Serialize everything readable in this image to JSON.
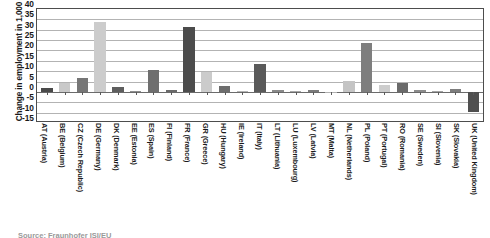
{
  "chart_data": {
    "type": "bar",
    "title": "",
    "xlabel": "",
    "ylabel": "Change in employment in 1,000",
    "ylim": [
      -15,
      40
    ],
    "yticks": [
      40,
      35,
      30,
      25,
      20,
      15,
      10,
      5,
      0,
      -5,
      -10,
      -15
    ],
    "grid": true,
    "legend": "none",
    "categories": [
      "AT (Austria)",
      "BE (Belgium)",
      "CZ (Czech Republic)",
      "DE (Germany)",
      "DK (Denmark)",
      "EE (Estonia)",
      "ES (Spain)",
      "FI (Finland)",
      "FR (France)",
      "GR (Greece)",
      "HU (Hungary)",
      "IE (Ireland)",
      "IT (Italy)",
      "LT (Lithuania)",
      "LU (Luxembourg)",
      "LV (Latvia)",
      "MT (Malta)",
      "NL (Netherlands)",
      "PL (Poland)",
      "PT (Portugal)",
      "RO (Romania)",
      "SE (Sweden)",
      "SI (Slovenia)",
      "SK (Slovakia)",
      "UK (United Kingdom)"
    ],
    "values": [
      2.0,
      4.1,
      6.9,
      33.6,
      2.6,
      0.4,
      10.7,
      1.0,
      31.3,
      9.8,
      2.7,
      0.2,
      13.6,
      0.7,
      0.2,
      0.9,
      0.1,
      5.2,
      23.7,
      3.4,
      4.4,
      0.8,
      0.3,
      1.4,
      -9.6
    ],
    "bar_colors": [
      "#4a4a4a",
      "#c9c9c9",
      "#767676",
      "#cccccc",
      "#5e5e5e",
      "#8f8f8f",
      "#6e6e6e",
      "#6a6a6a",
      "#4c4c4c",
      "#cbcbcb",
      "#6d6d6d",
      "#b5b5b5",
      "#5a5a5a",
      "#8a8a8a",
      "#a8a8a8",
      "#7a7a7a",
      "#b0b0b0",
      "#c4c4c4",
      "#7e7e7e",
      "#cdcdcd",
      "#6a6a6a",
      "#8c8c8c",
      "#a4a4a4",
      "#7d7d7d",
      "#4f4f4f"
    ]
  },
  "axis": {
    "y_title": "Change in employment in 1,000"
  },
  "footer": {
    "source": "Source: Fraunhofer ISI/EU"
  },
  "colors": {
    "grid": "#b3b3b3",
    "axis": "#4d4d4d",
    "zero": "#6b6b6b",
    "text": "#1a1a1a"
  }
}
